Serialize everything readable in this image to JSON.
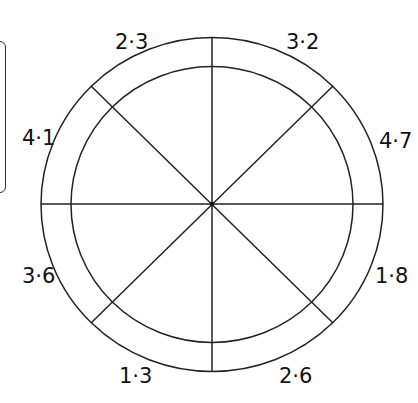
{
  "diagram": {
    "type": "segmented-circle",
    "center": [
      212,
      204
    ],
    "outer_radius": [
      171,
      167
    ],
    "inner_radius": [
      141,
      138
    ],
    "stroke_color": "#222222",
    "labels": [
      {
        "id": "top-left",
        "text": "2·3"
      },
      {
        "id": "top-right",
        "text": "3·2"
      },
      {
        "id": "right-upper",
        "text": "4·7"
      },
      {
        "id": "right-lower",
        "text": "1·8"
      },
      {
        "id": "bottom-right",
        "text": "2·6"
      },
      {
        "id": "bottom-left",
        "text": "1·3"
      },
      {
        "id": "left-lower",
        "text": "3·6"
      },
      {
        "id": "left-upper",
        "text": "4·1"
      }
    ]
  }
}
